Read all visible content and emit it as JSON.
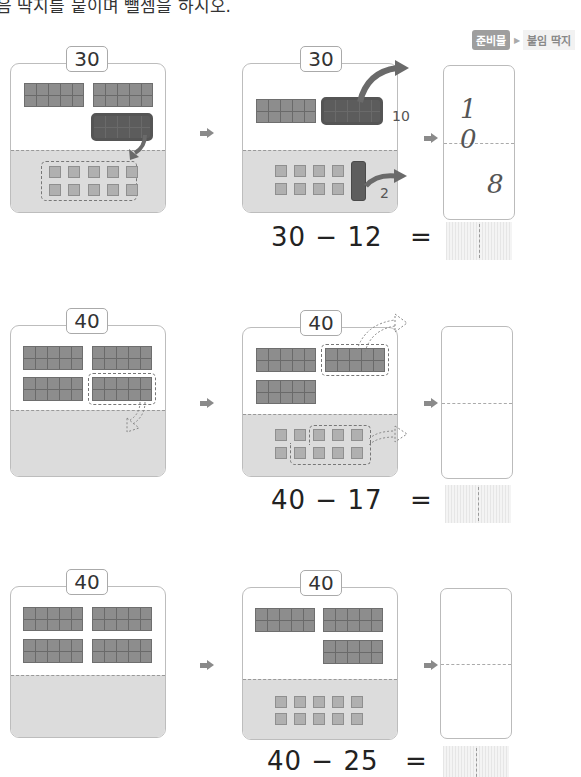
{
  "instruction": "음 딱지를 붙이며 뺄셈을 하시오.",
  "prep": {
    "badge": "준비물",
    "item": "붙임 딱지"
  },
  "problems": [
    {
      "start_number": "30",
      "step_number": "30",
      "expression": "30 − 12",
      "equals": "=",
      "tens_label": "10",
      "ones_label": "2",
      "card": {
        "tens": "1 0",
        "ones": "8"
      }
    },
    {
      "start_number": "40",
      "step_number": "40",
      "expression": "40 − 17",
      "equals": "=",
      "card": {
        "tens": "",
        "ones": ""
      }
    },
    {
      "start_number": "40",
      "step_number": "40",
      "expression": "40 − 25",
      "equals": "=",
      "card": {
        "tens": "",
        "ones": ""
      }
    }
  ],
  "colors": {
    "block": "#8d8d8d",
    "block_dark": "#5c5c5c",
    "unit": "#b0b0b0",
    "lower_area": "#dcdcdc"
  }
}
